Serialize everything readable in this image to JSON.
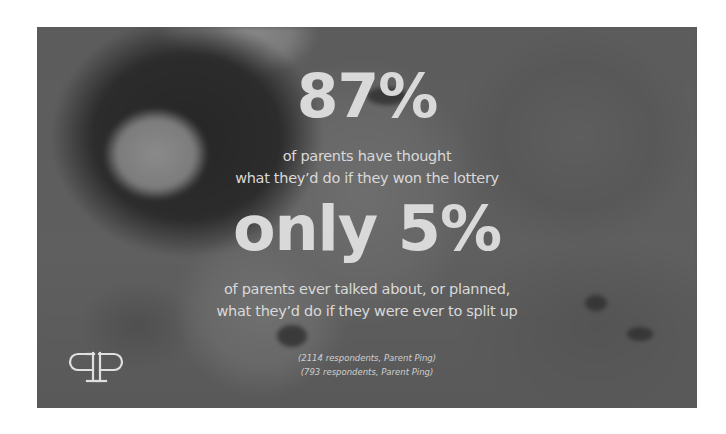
{
  "infographic": {
    "stat_1": {
      "value": "87%",
      "caption_lines": [
        "of parents have thought",
        "what they’d do if they won the lottery"
      ]
    },
    "stat_2": {
      "value": "only 5%",
      "caption_lines": [
        "of parents ever talked about, or planned,",
        "what they’d do if they were ever to split up"
      ]
    },
    "footnotes": [
      "(2114 respondents, Parent Ping)",
      "(793 respondents, Parent Ping)"
    ],
    "logo": {
      "icon": "parent-ping-logo-icon",
      "glyphs": "qP"
    },
    "background": {
      "description": "blurred grayscale photo of lottery balls"
    },
    "colors": {
      "text": "#d9d9d9",
      "panel_base": "#5a5a5a",
      "page_background": "#ffffff"
    }
  }
}
